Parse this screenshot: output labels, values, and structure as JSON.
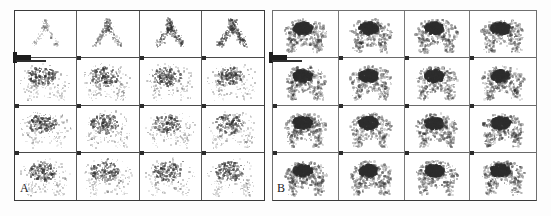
{
  "figure": {
    "background_color": "#ffffff",
    "ink_color": "#2d2d2d",
    "width": 551,
    "height": 216
  },
  "panels": [
    {
      "id": "A",
      "label": "A",
      "label_position": "bottom-left",
      "rows": 4,
      "columns": 4,
      "frame_count": 16,
      "border_color": "#3a3a3a",
      "description": "sparse low-count speckled uptake, inverted-V vascular pattern in first row",
      "marker": {
        "name": "scale-bar",
        "color": "#1d1d1d"
      }
    },
    {
      "id": "B",
      "label": "B",
      "label_position": "bottom-left",
      "rows": 4,
      "columns": 4,
      "frame_count": 16,
      "border_color": "#6f6f6f",
      "description": "dense blob-like high-count uptake with dark focal core",
      "marker": {
        "name": "scale-bar",
        "color": "#1d1d1d"
      }
    }
  ],
  "chart_data": {
    "type": "heatmap",
    "xlabel": "",
    "ylabel": "",
    "legend": [],
    "panels": [
      {
        "panel": "A",
        "rows": 4,
        "columns": 4,
        "intensity_scale": [
          0,
          1
        ],
        "frame_intensity": [
          [
            0.1,
            0.26,
            0.4,
            0.46
          ],
          [
            0.52,
            0.5,
            0.47,
            0.44
          ],
          [
            0.5,
            0.48,
            0.46,
            0.43
          ],
          [
            0.52,
            0.5,
            0.47,
            0.45
          ]
        ],
        "frame_spread": [
          [
            0.3,
            0.46,
            0.58,
            0.62
          ],
          [
            0.78,
            0.76,
            0.74,
            0.72
          ],
          [
            0.78,
            0.76,
            0.74,
            0.72
          ],
          [
            0.8,
            0.78,
            0.76,
            0.74
          ]
        ],
        "pattern": [
          "vascular",
          "vascular",
          "vascular",
          "vascular",
          "diffuse",
          "diffuse",
          "diffuse",
          "diffuse",
          "diffuse",
          "diffuse",
          "diffuse",
          "diffuse",
          "diffuse",
          "diffuse",
          "diffuse",
          "diffuse"
        ]
      },
      {
        "panel": "B",
        "rows": 4,
        "columns": 4,
        "intensity_scale": [
          0,
          1
        ],
        "frame_intensity": [
          [
            0.92,
            0.9,
            0.88,
            0.9
          ],
          [
            0.94,
            0.92,
            0.9,
            0.91
          ],
          [
            0.93,
            0.91,
            0.9,
            0.9
          ],
          [
            0.93,
            0.92,
            0.91,
            0.9
          ]
        ],
        "frame_spread": [
          [
            0.86,
            0.86,
            0.85,
            0.86
          ],
          [
            0.88,
            0.88,
            0.87,
            0.88
          ],
          [
            0.88,
            0.88,
            0.87,
            0.87
          ],
          [
            0.89,
            0.88,
            0.88,
            0.87
          ]
        ],
        "pattern": [
          "focal",
          "focal",
          "focal",
          "focal",
          "focal",
          "focal",
          "focal",
          "focal",
          "focal",
          "focal",
          "focal",
          "focal",
          "focal",
          "focal",
          "focal",
          "focal"
        ]
      }
    ]
  }
}
